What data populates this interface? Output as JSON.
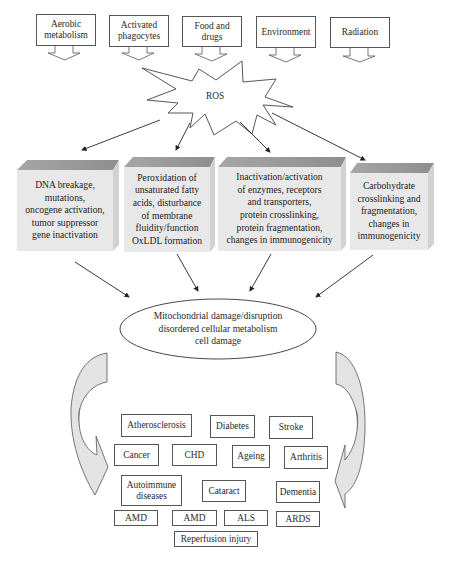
{
  "sources": [
    {
      "label": "Aerobic\nmetabolism"
    },
    {
      "label": "Activated\nphagocytes"
    },
    {
      "label": "Food and\ndrugs"
    },
    {
      "label": "Environment"
    },
    {
      "label": "Radiation"
    }
  ],
  "center": {
    "label": "ROS"
  },
  "effects": [
    {
      "label": "DNA breakage,\nmutations,\noncogene activation,\ntumor suppressor\ngene inactivation"
    },
    {
      "label": "Peroxidation of\nunsaturated fatty\nacids, disturbance\nof membrane\nfluidity/function\nOxLDL formation"
    },
    {
      "label": "Inactivation/activation\nof enzymes, receptors\nand transporters,\nprotein crosslinking,\nprotein fragmentation,\nchanges in immunogenicity"
    },
    {
      "label": "Carbohydrate\ncrosslinking and\nfragmentation,\nchanges in\nimmunogenicity"
    }
  ],
  "outcome": {
    "label": "Mitochondrial damage/disruption\ndisordered cellular metabolism\ncell damage"
  },
  "diseases": [
    {
      "label": "Atherosclerosis"
    },
    {
      "label": "Diabetes"
    },
    {
      "label": "Stroke"
    },
    {
      "label": "Cancer"
    },
    {
      "label": "CHD"
    },
    {
      "label": "Ageing"
    },
    {
      "label": "Arthritis"
    },
    {
      "label": "Autoimmune\ndiseases"
    },
    {
      "label": "Cataract"
    },
    {
      "label": "Dementia"
    },
    {
      "label": "AMD"
    },
    {
      "label": "AMD"
    },
    {
      "label": "ALS"
    },
    {
      "label": "ARDS"
    },
    {
      "label": "Reperfusion injury"
    }
  ],
  "colors": {
    "block_face": "#e6e6e6",
    "block_top": "#9a9a9a",
    "arrow_fill": "#e3e3e3",
    "line": "#333333"
  }
}
